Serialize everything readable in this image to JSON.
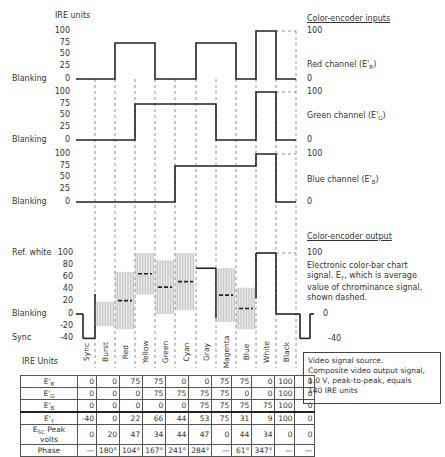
{
  "header": {
    "left_axis_title": "IRE units",
    "inputs_title": "Color-encoder inputs",
    "output_title": "Color-encoder output"
  },
  "channels": [
    {
      "name": "Red channel (E'R)",
      "label_main": "Red channel (E'",
      "label_sub": "R",
      "label_end": ")",
      "top_value": "100",
      "bottom_value": "0",
      "ticks": [
        "100",
        "75",
        "50",
        "25",
        "0"
      ],
      "baseline_label": "Blanking"
    },
    {
      "name": "Green channel (E'G)",
      "label_main": "Green channel (E'",
      "label_sub": "G",
      "label_end": ")",
      "top_value": "100",
      "bottom_value": "0",
      "ticks": [
        "100",
        "75",
        "50",
        "25",
        "0"
      ],
      "baseline_label": "Blanking"
    },
    {
      "name": "Blue channel (E'B)",
      "label_main": "Blue channel (E'",
      "label_sub": "B",
      "label_end": ")",
      "top_value": "100",
      "bottom_value": "0",
      "ticks": [
        "100",
        "75",
        "50",
        "25",
        "0"
      ],
      "baseline_label": "Blanking"
    }
  ],
  "composite": {
    "ticks": [
      "100",
      "80",
      "60",
      "40",
      "20",
      "0",
      "-20",
      "-40"
    ],
    "ref_white_label": "Ref. white",
    "blanking_label": "Blanking",
    "sync_label": "Sync",
    "right_top": "100",
    "right_zero": "0",
    "right_sync": "-40",
    "description_line1": "Electronic color-bar chart",
    "description_line2": "signal. E",
    "description_sub": "Y",
    "description_line2b": ", which is average",
    "description_line3": "value of chrominance signal,",
    "description_line4": "shown dashed."
  },
  "note": {
    "line1": "Video signal source.",
    "line2": "Composite video output signal,",
    "line3": "1.0 V, peak-to-peak, equals",
    "line4": "140 IRE units"
  },
  "table": {
    "corner_label": "IRE Units",
    "columns": [
      "Sync",
      "Burst",
      "Red",
      "Yellow",
      "Green",
      "Cyan",
      "Gray",
      "Magenta",
      "Blue",
      "White",
      "Black"
    ],
    "rows": [
      {
        "label": "E'R",
        "label_main": "E'",
        "label_sub": "R",
        "values": [
          "0",
          "0",
          "75",
          "75",
          "0",
          "0",
          "75",
          "75",
          "0",
          "100",
          "0"
        ]
      },
      {
        "label": "E'G",
        "label_main": "E'",
        "label_sub": "G",
        "values": [
          "0",
          "0",
          "0",
          "75",
          "75",
          "75",
          "75",
          "0",
          "0",
          "100",
          "0"
        ]
      },
      {
        "label": "E'B",
        "label_main": "E'",
        "label_sub": "B",
        "values": [
          "0",
          "0",
          "0",
          "0",
          "0",
          "75",
          "75",
          "75",
          "75",
          "100",
          "0"
        ]
      },
      {
        "label": "E'Y",
        "label_main": "E'",
        "label_sub": "Y",
        "values": [
          "-40",
          "0",
          "22",
          "66",
          "44",
          "53",
          "75",
          "31",
          "9",
          "100",
          "0"
        ]
      },
      {
        "label": "ESC Peak volts",
        "label_main": "E",
        "label_sub": "SC",
        "label_end": " Peak volts",
        "values": [
          "0",
          "20",
          "47",
          "34",
          "44",
          "47",
          "0",
          "44",
          "34",
          "0",
          "0"
        ]
      },
      {
        "label": "Phase",
        "label_main": "Phase",
        "label_sub": "",
        "values": [
          "—",
          "180°",
          "104°",
          "167°",
          "241°",
          "284°",
          "—",
          "61°",
          "347°",
          "—",
          "—"
        ]
      }
    ]
  },
  "chart_data": {
    "type": "table",
    "categories": [
      "Sync",
      "Burst",
      "Red",
      "Yellow",
      "Green",
      "Cyan",
      "Gray",
      "Magenta",
      "Blue",
      "White",
      "Black"
    ],
    "series": [
      {
        "name": "E'R",
        "values": [
          0,
          0,
          75,
          75,
          0,
          0,
          75,
          75,
          0,
          100,
          0
        ]
      },
      {
        "name": "E'G",
        "values": [
          0,
          0,
          0,
          75,
          75,
          75,
          75,
          0,
          0,
          100,
          0
        ]
      },
      {
        "name": "E'B",
        "values": [
          0,
          0,
          0,
          0,
          0,
          75,
          75,
          75,
          75,
          100,
          0
        ]
      },
      {
        "name": "E'Y",
        "values": [
          -40,
          0,
          22,
          66,
          44,
          53,
          75,
          31,
          9,
          100,
          0
        ]
      },
      {
        "name": "ESC Peak volts",
        "values": [
          0,
          20,
          47,
          34,
          44,
          47,
          0,
          44,
          34,
          0,
          0
        ]
      },
      {
        "name": "Phase (deg)",
        "values": [
          null,
          180,
          104,
          167,
          241,
          284,
          null,
          61,
          347,
          null,
          null
        ]
      }
    ],
    "ylabel": "IRE units",
    "ylim_inputs": [
      0,
      100
    ],
    "ylim_output": [
      -40,
      100
    ]
  }
}
